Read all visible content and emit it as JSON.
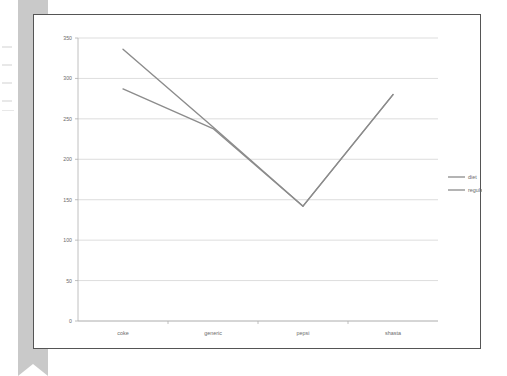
{
  "figure": {
    "background_color": "#ffffff",
    "frame_border_color": "#555555",
    "sidebar_color": "#c9c9c9",
    "gridline_color": "#d4d4d4",
    "axis_color": "#b0b0b0",
    "tick_text_color": "#6b6b6b"
  },
  "chart_data": {
    "type": "line",
    "title": "",
    "subtitle": "",
    "xlabel": "",
    "ylabel": "",
    "categories": [
      "coke",
      "generic",
      "pepsi",
      "shasta"
    ],
    "series": [
      {
        "name": "diet",
        "color": "#8c8c8c",
        "values": [
          336,
          240,
          142,
          280
        ]
      },
      {
        "name": "regular",
        "color": "#8c8c8c",
        "values": [
          287,
          238,
          142,
          280
        ]
      }
    ],
    "ylim": [
      0,
      350
    ],
    "yticks": [
      0,
      50,
      100,
      150,
      200,
      250,
      300,
      350
    ],
    "ytick_labels": [
      "0",
      "50",
      "100",
      "150",
      "200",
      "250",
      "300",
      "350"
    ],
    "grid": true,
    "grid_axis": "y",
    "legend": {
      "position": "right",
      "entries": [
        "diet",
        "regular"
      ]
    }
  }
}
